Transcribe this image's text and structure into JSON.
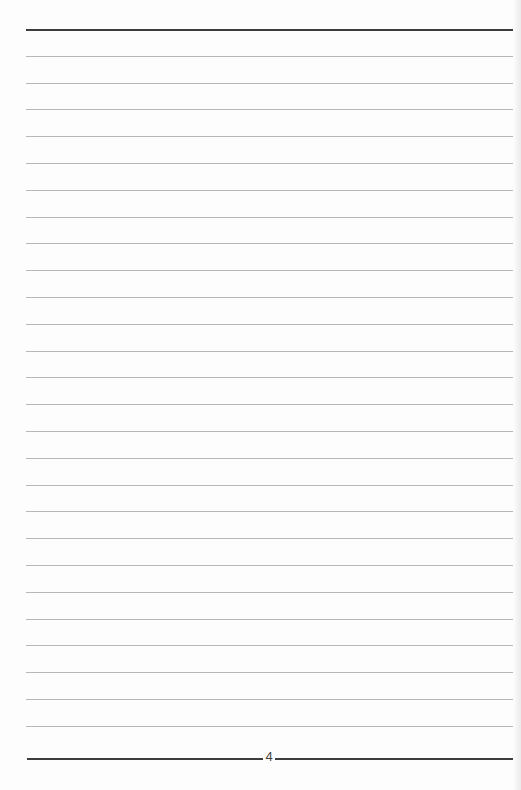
{
  "page": {
    "type": "lined-notebook-page",
    "page_number": "4",
    "ruled_lines": {
      "count_thin": 26,
      "top_thick_y": 29,
      "bottom_thick_y": 753,
      "spacing_px": 26.8
    },
    "colors": {
      "thick_rule": "#3d3d3d",
      "thin_rule": "#b8b8b8",
      "paper": "#fdfdfd"
    }
  }
}
